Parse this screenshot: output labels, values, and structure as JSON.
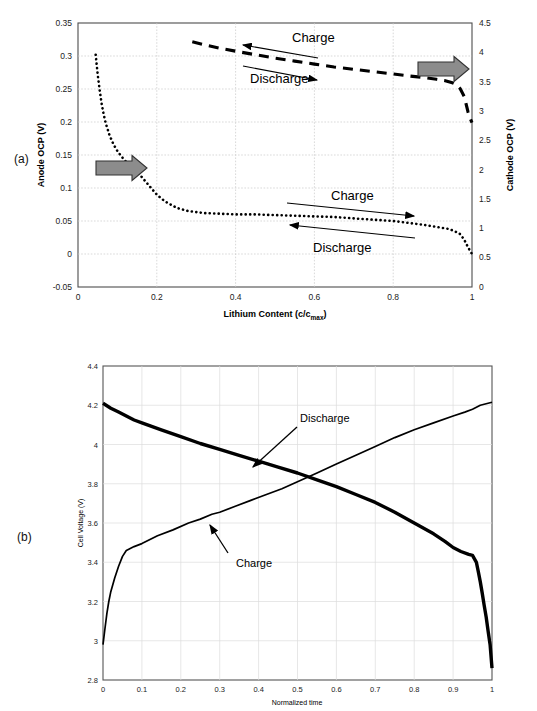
{
  "figure": {
    "panel_a_label": "(a)",
    "panel_b_label": "(b)"
  },
  "panel_a": {
    "xlabel_main": "Lithium Content (c/c",
    "xlabel_sub": "max",
    "xlabel_close": ")",
    "ylabel_left": "Anode OCP (V)",
    "ylabel_right": "Cathode OCP (V)",
    "x_ticks": [
      "0",
      "0.2",
      "0.4",
      "0.6",
      "0.8",
      "1"
    ],
    "y_left_ticks": [
      "0.35",
      "0.3",
      "0.25",
      "0.2",
      "0.15",
      "0.1",
      "0.05",
      "0",
      "-0.05"
    ],
    "y_right_ticks": [
      "4.5",
      "4",
      "3.5",
      "3",
      "2.5",
      "2",
      "1.5",
      "1",
      "0.5",
      "0"
    ],
    "annotations": [
      {
        "name": "cathode-charge",
        "text": "Charge",
        "direction": "left"
      },
      {
        "name": "cathode-discharge",
        "text": "Discharge",
        "direction": "right"
      },
      {
        "name": "anode-charge",
        "text": "Charge",
        "direction": "right"
      },
      {
        "name": "anode-discharge",
        "text": "Discharge",
        "direction": "left"
      }
    ],
    "pointer_arrow_left": "points-to-left-axis",
    "pointer_arrow_right": "points-to-right-axis",
    "arrow_color": "#808080"
  },
  "panel_b": {
    "xlabel": "Normalized time",
    "ylabel": "Cell Voltage (V)",
    "x_ticks": [
      "0",
      "0.1",
      "0.2",
      "0.3",
      "0.4",
      "0.5",
      "0.6",
      "0.7",
      "0.8",
      "0.9",
      "1"
    ],
    "y_ticks": [
      "4.4",
      "4.2",
      "4",
      "3.8",
      "3.6",
      "3.4",
      "3.2",
      "3",
      "2.8"
    ],
    "annotations": [
      {
        "name": "discharge-callout",
        "text": "Discharge"
      },
      {
        "name": "charge-callout",
        "text": "Charge"
      }
    ]
  },
  "chart_data": [
    {
      "type": "line",
      "name": "panel-a-ocp-curves",
      "title": "",
      "xlabel": "Lithium Content (c/cmax)",
      "ylabel": "Anode OCP (V)",
      "y2label": "Cathode OCP (V)",
      "xlim": [
        0,
        1
      ],
      "ylim": [
        -0.05,
        0.35
      ],
      "y2lim": [
        0,
        4.5
      ],
      "grid": true,
      "legend": "none",
      "series": [
        {
          "name": "Anode OCP",
          "axis": "left",
          "style": "dotted",
          "x": [
            0.045,
            0.05,
            0.055,
            0.06,
            0.065,
            0.07,
            0.08,
            0.09,
            0.1,
            0.11,
            0.12,
            0.14,
            0.16,
            0.18,
            0.2,
            0.22,
            0.25,
            0.28,
            0.32,
            0.36,
            0.4,
            0.45,
            0.5,
            0.55,
            0.6,
            0.65,
            0.7,
            0.75,
            0.8,
            0.84,
            0.88,
            0.9,
            0.92,
            0.94,
            0.955,
            0.97,
            0.98,
            0.99,
            1.0
          ],
          "y": [
            0.302,
            0.272,
            0.248,
            0.228,
            0.212,
            0.199,
            0.18,
            0.166,
            0.156,
            0.148,
            0.141,
            0.13,
            0.118,
            0.104,
            0.09,
            0.08,
            0.07,
            0.065,
            0.062,
            0.061,
            0.06,
            0.06,
            0.059,
            0.058,
            0.057,
            0.056,
            0.054,
            0.052,
            0.05,
            0.047,
            0.044,
            0.042,
            0.04,
            0.038,
            0.035,
            0.03,
            0.022,
            0.01,
            0.0
          ]
        },
        {
          "name": "Cathode OCP",
          "axis": "right",
          "style": "dashed",
          "x": [
            0.29,
            0.32,
            0.36,
            0.4,
            0.45,
            0.5,
            0.55,
            0.6,
            0.65,
            0.7,
            0.75,
            0.8,
            0.85,
            0.88,
            0.91,
            0.93,
            0.95,
            0.96,
            0.97,
            0.98,
            0.985,
            0.99,
            0.995,
            1.0
          ],
          "y": [
            4.18,
            4.13,
            4.07,
            4.02,
            3.96,
            3.9,
            3.85,
            3.8,
            3.75,
            3.71,
            3.67,
            3.63,
            3.59,
            3.57,
            3.54,
            3.52,
            3.48,
            3.45,
            3.38,
            3.25,
            3.12,
            2.98,
            2.88,
            2.8
          ]
        }
      ]
    },
    {
      "type": "line",
      "name": "panel-b-cell-voltage",
      "title": "",
      "xlabel": "Normalized time",
      "ylabel": "Cell Voltage (V)",
      "xlim": [
        0,
        1
      ],
      "ylim": [
        2.8,
        4.4
      ],
      "grid": true,
      "legend": "none",
      "series": [
        {
          "name": "Discharge",
          "style": "solid-thick",
          "x": [
            0.0,
            0.02,
            0.04,
            0.06,
            0.08,
            0.1,
            0.15,
            0.2,
            0.25,
            0.3,
            0.35,
            0.4,
            0.45,
            0.5,
            0.55,
            0.6,
            0.65,
            0.7,
            0.75,
            0.8,
            0.85,
            0.88,
            0.9,
            0.92,
            0.94,
            0.95,
            0.96,
            0.965,
            0.97,
            0.975,
            0.98,
            0.985,
            0.99,
            0.995,
            1.0
          ],
          "y": [
            4.21,
            4.185,
            4.165,
            4.145,
            4.125,
            4.11,
            4.075,
            4.04,
            4.005,
            3.975,
            3.945,
            3.915,
            3.885,
            3.855,
            3.82,
            3.785,
            3.745,
            3.705,
            3.655,
            3.6,
            3.545,
            3.505,
            3.475,
            3.455,
            3.44,
            3.435,
            3.4,
            3.35,
            3.3,
            3.24,
            3.18,
            3.12,
            3.05,
            2.98,
            2.86
          ]
        },
        {
          "name": "Charge",
          "style": "solid-thin",
          "x": [
            0.0,
            0.005,
            0.01,
            0.015,
            0.02,
            0.03,
            0.04,
            0.05,
            0.06,
            0.065,
            0.07,
            0.08,
            0.1,
            0.14,
            0.18,
            0.22,
            0.25,
            0.28,
            0.3,
            0.34,
            0.38,
            0.42,
            0.46,
            0.5,
            0.55,
            0.6,
            0.65,
            0.7,
            0.75,
            0.8,
            0.85,
            0.9,
            0.93,
            0.95,
            0.96,
            0.97,
            0.98,
            0.99,
            1.0
          ],
          "y": [
            2.98,
            3.06,
            3.14,
            3.2,
            3.25,
            3.32,
            3.38,
            3.43,
            3.46,
            3.465,
            3.47,
            3.48,
            3.495,
            3.535,
            3.565,
            3.6,
            3.62,
            3.645,
            3.655,
            3.685,
            3.715,
            3.745,
            3.775,
            3.81,
            3.855,
            3.9,
            3.945,
            3.99,
            4.035,
            4.075,
            4.11,
            4.145,
            4.165,
            4.18,
            4.19,
            4.2,
            4.205,
            4.21,
            4.215
          ]
        }
      ]
    }
  ]
}
